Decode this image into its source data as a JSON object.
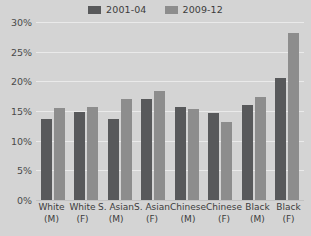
{
  "chart_data": {
    "type": "bar",
    "title": "",
    "xlabel": "",
    "ylabel": "",
    "categories": [
      "White (M)",
      "White (F)",
      "S. Asian (M)",
      "S. Asian (F)",
      "Chinese (M)",
      "Chinese (F)",
      "Black (M)",
      "Black (F)"
    ],
    "category_lines": [
      [
        "White",
        "(M)"
      ],
      [
        "White",
        "(F)"
      ],
      [
        "S. Asian",
        "(M)"
      ],
      [
        "S. Asian",
        "(F)"
      ],
      [
        "Chinese",
        "(M)"
      ],
      [
        "Chinese",
        "(F)"
      ],
      [
        "Black",
        "(M)"
      ],
      [
        "Black",
        "(F)"
      ]
    ],
    "series": [
      {
        "name": "2001-04",
        "color": "#58595b",
        "values": [
          13.6,
          14.8,
          13.6,
          17.1,
          15.6,
          14.6,
          16.0,
          20.6
        ]
      },
      {
        "name": "2009-12",
        "color": "#8d8d8d",
        "values": [
          15.5,
          15.7,
          17.1,
          18.4,
          15.4,
          13.2,
          17.3,
          28.2
        ]
      }
    ],
    "ylim": [
      0,
      30
    ],
    "yticks": [
      0,
      5,
      10,
      15,
      20,
      25,
      30
    ],
    "ytick_labels": [
      "0%",
      "5%",
      "10%",
      "15%",
      "20%",
      "25%",
      "30%"
    ],
    "grid": true,
    "legend_position": "top-center"
  },
  "legend": {
    "entries": [
      {
        "label": "2001-04",
        "color": "#58595b"
      },
      {
        "label": "2009-12",
        "color": "#8d8d8d"
      }
    ]
  },
  "colors": {
    "background": "#d4d4d4",
    "gridline": "#eaeaea",
    "baseline": "#c2c2c2",
    "axis_text": "#4a4a4a",
    "label_text": "#3c3c3c"
  }
}
